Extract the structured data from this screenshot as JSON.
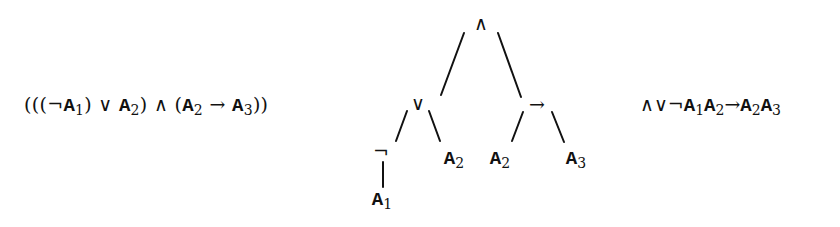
{
  "infix_formula": {
    "text": "(((¬A1) ∨ A2) ∧ (A2 → A3))",
    "parts": {
      "p1": "(((",
      "neg": "¬",
      "a1": "A",
      "a1_sub": "1",
      "p2": ") ∨ ",
      "a2": "A",
      "a2_sub": "2",
      "p3": ") ∧ (",
      "a3": "A",
      "a3_sub": "2",
      "arrow": " → ",
      "a4": "A",
      "a4_sub": "3",
      "p4": "))"
    }
  },
  "tree": {
    "root": {
      "symbol": "∧"
    },
    "or_node": {
      "symbol": "∨"
    },
    "imp_node": {
      "symbol": "→"
    },
    "neg_node": {
      "symbol": "¬"
    },
    "leaf_a1": {
      "letter": "A",
      "sub": "1"
    },
    "leaf_a2_left": {
      "letter": "A",
      "sub": "2"
    },
    "leaf_a2_right": {
      "letter": "A",
      "sub": "2"
    },
    "leaf_a3": {
      "letter": "A",
      "sub": "3"
    }
  },
  "prefix_formula": {
    "text": "∧∨¬A1A2→A2A3",
    "parts": {
      "ops": "∧∨¬",
      "a1": "A",
      "a1_sub": "1",
      "a2": "A",
      "a2_sub": "2",
      "arrow": "→",
      "a3": "A",
      "a3_sub": "2",
      "a4": "A",
      "a4_sub": "3"
    }
  }
}
